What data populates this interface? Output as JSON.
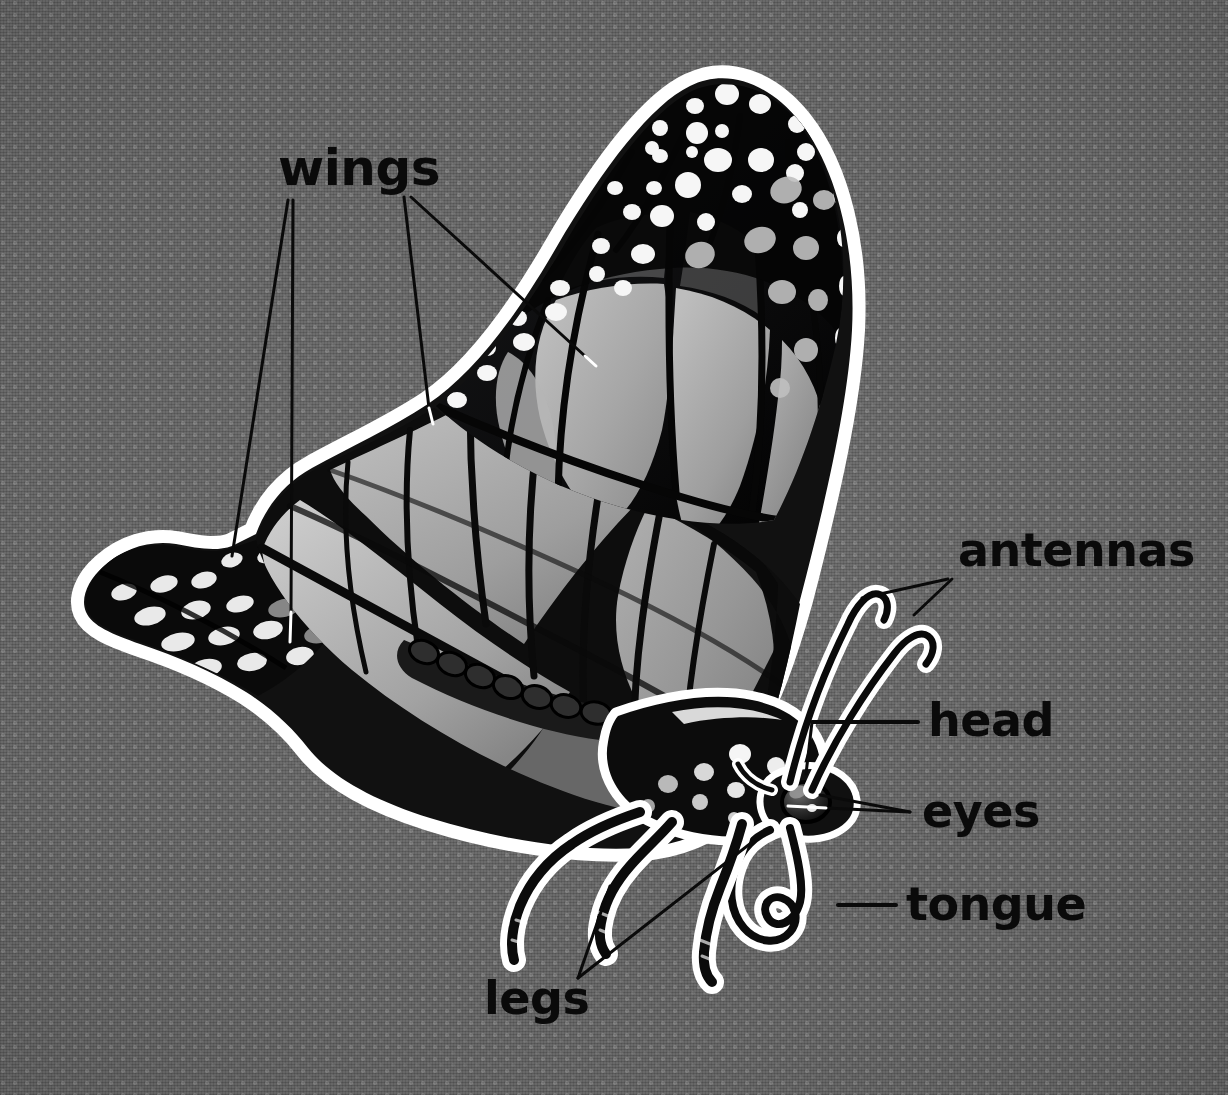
{
  "diagram": {
    "style": "labelled anatomy illustration",
    "background_color": "#626262",
    "background_pattern": "fine dotted fabric grid",
    "outline_color": "#ffffff",
    "ink_color": "#0a0a0a",
    "wing_fill_color": "#a9a9a9",
    "spot_color": "#f2f2f2"
  },
  "labels": [
    {
      "id": "wings",
      "text": "wings",
      "x": 278,
      "y": 185,
      "font_size": 50,
      "anchor": "start",
      "leader_count": 3
    },
    {
      "id": "antennas",
      "text": "antennas",
      "x": 958,
      "y": 566,
      "font_size": 46,
      "anchor": "start",
      "leader_count": 2
    },
    {
      "id": "head",
      "text": "head",
      "x": 928,
      "y": 736,
      "font_size": 46,
      "anchor": "start",
      "leader_count": 1
    },
    {
      "id": "eyes",
      "text": "eyes",
      "x": 922,
      "y": 827,
      "font_size": 46,
      "anchor": "start",
      "leader_count": 2
    },
    {
      "id": "tongue",
      "text": "tongue",
      "x": 906,
      "y": 920,
      "font_size": 46,
      "anchor": "start",
      "leader_count": 1
    },
    {
      "id": "legs",
      "text": "legs",
      "x": 484,
      "y": 1014,
      "font_size": 46,
      "anchor": "start",
      "leader_count": 2
    }
  ],
  "leader_lines": [
    {
      "label": "wings",
      "from_x": 288,
      "from_y": 200,
      "to_x": 232,
      "to_y": 556,
      "stroke": "dark"
    },
    {
      "label": "wings",
      "from_x": 292,
      "from_y": 200,
      "to_x": 290,
      "to_y": 636,
      "stroke": "dark"
    },
    {
      "label": "wings",
      "from_x": 404,
      "from_y": 196,
      "to_x": 430,
      "to_y": 414,
      "stroke": "dark"
    },
    {
      "label": "wings",
      "from_x": 410,
      "from_y": 196,
      "to_x": 586,
      "to_y": 360,
      "stroke": "dark"
    },
    {
      "label": "antennas",
      "from_x": 948,
      "from_y": 580,
      "to_x": 862,
      "to_y": 596,
      "stroke": "dark"
    },
    {
      "label": "antennas",
      "from_x": 952,
      "from_y": 580,
      "to_x": 914,
      "to_y": 612,
      "stroke": "dark"
    },
    {
      "label": "head",
      "from_x": 918,
      "from_y": 722,
      "to_x": 812,
      "to_y": 722,
      "stroke": "dark"
    },
    {
      "label": "head",
      "from_x": 812,
      "from_y": 722,
      "to_x": 806,
      "to_y": 772,
      "stroke": "dark"
    },
    {
      "label": "eyes",
      "from_x": 912,
      "from_y": 812,
      "to_x": 818,
      "to_y": 796,
      "stroke": "dark"
    },
    {
      "label": "eyes",
      "from_x": 912,
      "from_y": 812,
      "to_x": 792,
      "to_y": 808,
      "stroke": "dark"
    },
    {
      "label": "tongue",
      "from_x": 896,
      "from_y": 905,
      "to_x": 836,
      "to_y": 905,
      "stroke": "dark"
    },
    {
      "label": "legs",
      "from_x": 578,
      "from_y": 978,
      "to_x": 600,
      "to_y": 888,
      "stroke": "dark"
    },
    {
      "label": "legs",
      "from_x": 578,
      "from_y": 978,
      "to_x": 756,
      "to_y": 834,
      "stroke": "dark"
    }
  ],
  "parts": [
    {
      "name": "forewing",
      "description": "large upright wing, black apex with white spots, gray veined cells"
    },
    {
      "name": "hindwing",
      "description": "lower wing extending left into a spotted tail"
    },
    {
      "name": "thorax",
      "description": "black body with white spots"
    },
    {
      "name": "abdomen",
      "description": "segmented body under the wing"
    },
    {
      "name": "antennae",
      "description": "two clubbed feelers curving upward with hooked tips"
    },
    {
      "name": "eye",
      "description": "rounded compound eye with highlight"
    },
    {
      "name": "proboscis",
      "description": "coiled tongue spiralling below the head"
    },
    {
      "name": "legs",
      "description": "two jointed legs pointing down and forward"
    }
  ]
}
